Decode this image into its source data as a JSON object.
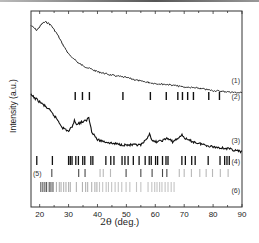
{
  "chart_data": {
    "type": "line",
    "title": "",
    "xlabel": "2θ (deg.)",
    "ylabel": "Intensity (a.u.)",
    "xlim": [
      17,
      90
    ],
    "xticks": [
      20,
      30,
      40,
      50,
      60,
      70,
      80,
      90
    ],
    "grid": false,
    "legend": "inline labels at right",
    "series": [
      {
        "name": "(1)",
        "kind": "xrd-pattern",
        "x": [
          17,
          18,
          19,
          20,
          21,
          22,
          23,
          24,
          26,
          28,
          30,
          31,
          32,
          33,
          35,
          38,
          40,
          45,
          50,
          55,
          60,
          65,
          70,
          75,
          80,
          85,
          90
        ],
        "y": [
          0.8,
          0.78,
          0.76,
          0.79,
          0.82,
          0.83,
          0.82,
          0.8,
          0.73,
          0.64,
          0.56,
          0.53,
          0.52,
          0.49,
          0.46,
          0.43,
          0.41,
          0.38,
          0.36,
          0.33,
          0.31,
          0.3,
          0.28,
          0.27,
          0.25,
          0.24,
          0.23
        ]
      },
      {
        "name": "(3)",
        "kind": "xrd-pattern",
        "x": [
          17,
          20,
          23,
          26,
          28,
          30,
          31,
          32,
          33,
          34,
          36,
          37,
          38,
          40,
          45,
          50,
          55,
          57,
          58,
          59,
          61,
          63,
          64,
          66,
          68,
          69,
          71,
          75,
          80,
          85,
          90
        ],
        "y": [
          0.64,
          0.6,
          0.56,
          0.5,
          0.45,
          0.43,
          0.45,
          0.49,
          0.47,
          0.48,
          0.49,
          0.51,
          0.43,
          0.38,
          0.36,
          0.35,
          0.35,
          0.38,
          0.42,
          0.37,
          0.37,
          0.38,
          0.39,
          0.37,
          0.39,
          0.41,
          0.38,
          0.36,
          0.34,
          0.33,
          0.31
        ]
      }
    ],
    "reference_patterns": [
      {
        "name": "(2)",
        "positions": [
          32.3,
          34.8,
          37.2,
          48.8,
          58.3,
          63.8,
          67.8,
          69.4,
          71.2,
          73.2,
          78.5,
          82.2
        ],
        "shade": "#111111"
      },
      {
        "name": "(4)",
        "positions": [
          19.0,
          24.4,
          30.0,
          30.6,
          31.2,
          32.5,
          33.4,
          34.9,
          35.6,
          37.7,
          38.4,
          42.9,
          44.6,
          45.7,
          48.5,
          49.5,
          50.6,
          52.4,
          54.4,
          56.5,
          57.9,
          58.6,
          60.1,
          60.8,
          62.5,
          63.7,
          64.4,
          69.2,
          70.4,
          72.6,
          73.8,
          78.3,
          82.4,
          84.0,
          84.8,
          85.6
        ],
        "shade": "#111111"
      },
      {
        "name": "(5)",
        "positions": [
          24.2,
          33.5,
          35.7,
          40.9,
          42.0,
          44.5,
          49.9,
          55.0,
          58.9,
          62.5,
          64.0,
          68.3,
          70.0,
          72.5,
          75.4,
          77.6,
          79.8,
          82.5,
          85.2
        ],
        "shade": "#333333"
      },
      {
        "name": "(6)",
        "positions": [
          20.4,
          21.1,
          21.8,
          22.4,
          23.3,
          23.9,
          24.6,
          25.8,
          26.8,
          27.4,
          28.3,
          29.1,
          30.0,
          30.6,
          32.7,
          34.8,
          35.9,
          36.6,
          38.0,
          39.1,
          39.8,
          40.7,
          41.8,
          43.0,
          43.8,
          44.9,
          46.1,
          47.2,
          48.4,
          49.9,
          51.2,
          53.5,
          55.0,
          57.5,
          58.8,
          59.8,
          60.6,
          61.5,
          62.3,
          63.4,
          64.4,
          65.5,
          66.5
        ],
        "shade": "#555555"
      }
    ],
    "curve_labels": [
      "(1)",
      "(2)",
      "(3)",
      "(4)",
      "(5)",
      "(6)"
    ]
  },
  "axis": {
    "xlabel_prefix": "2θ",
    "xlabel_unit": " (deg.)",
    "ylabel": "Intensity (a.u.)",
    "tick_labels": [
      "20",
      "30",
      "40",
      "50",
      "60",
      "70",
      "80",
      "90"
    ]
  },
  "colors": {
    "line": "#111111",
    "frame": "#333333",
    "tick_text": "#222222"
  }
}
